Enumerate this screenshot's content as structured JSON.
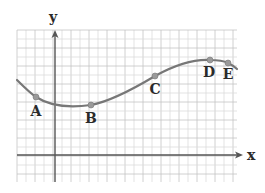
{
  "figure": {
    "width": 265,
    "height": 193,
    "grid": {
      "x0": 17,
      "y0": 30,
      "x1": 237,
      "y1": 182,
      "step": 9,
      "minor_color": "#dcdcdc",
      "major_color": "#c4c4c4"
    },
    "axes": {
      "origin": {
        "x": 55,
        "y": 155
      },
      "x_label": "x",
      "y_label": "y",
      "color": "#555555"
    },
    "curve": {
      "color": "#777777",
      "description": "Smooth curve decreasing to a minimum near B, then increasing to a maximum near D, then decreasing slightly after E"
    },
    "points": [
      {
        "label": "A",
        "x": 36,
        "y": 97,
        "label_x": 36,
        "label_y": 116
      },
      {
        "label": "B",
        "x": 91,
        "y": 105,
        "label_x": 91,
        "label_y": 123
      },
      {
        "label": "C",
        "x": 155,
        "y": 76,
        "label_x": 155,
        "label_y": 94
      },
      {
        "label": "D",
        "x": 210,
        "y": 60,
        "label_x": 209,
        "label_y": 77
      },
      {
        "label": "E",
        "x": 228,
        "y": 63,
        "label_x": 228,
        "label_y": 79
      }
    ],
    "point_color": "#9a9a9a"
  }
}
